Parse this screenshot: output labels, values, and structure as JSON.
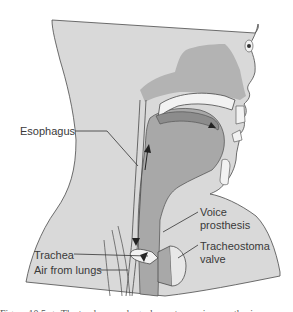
{
  "figure": {
    "labels": {
      "esophagus": "Esophagus",
      "voice_prosthesis_line1": "Voice",
      "voice_prosthesis_line2": "prosthesis",
      "trachea": "Trachea",
      "tracheostoma_valve_line1": "Tracheostoma",
      "tracheostoma_valve_line2": "valve",
      "air_from_lungs": "Air from lungs"
    },
    "caption_partial": "Figure 10.5 ▲ The tracheoesophageal puncture voice prosthesis"
  },
  "colors": {
    "background": "#ffffff",
    "skin": "#d9d9d9",
    "tissue": "#a8a8a8",
    "dark_tissue": "#8c8c8c",
    "light": "#f2f2f2",
    "outline": "#4a4a4a",
    "text": "#3a3a3a"
  }
}
